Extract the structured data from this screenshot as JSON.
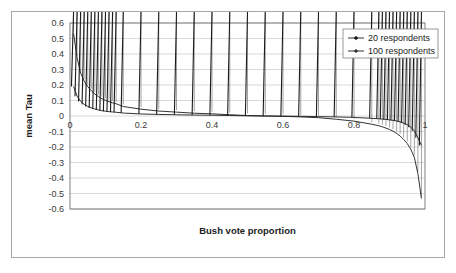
{
  "chart_data": {
    "type": "line",
    "title": "",
    "xlabel": "Bush vote proportion",
    "ylabel": "mean Tau",
    "xlim": [
      0,
      1
    ],
    "ylim": [
      -0.6,
      0.6
    ],
    "grid": true,
    "grid_axis": "y",
    "legend_position": "top-right",
    "xticks": [
      "0",
      "0.2",
      "0.4",
      "0.6",
      "0.8",
      "1"
    ],
    "xtick_values": [
      0,
      0.2,
      0.4,
      0.6,
      0.8,
      1
    ],
    "yticks": [
      "0.6",
      "0.5",
      "0.4",
      "0.3",
      "0.2",
      "0.1",
      "0",
      "-0.1",
      "-0.2",
      "-0.3",
      "-0.4",
      "-0.5",
      "-0.6"
    ],
    "ytick_values": [
      0.6,
      0.5,
      0.4,
      0.3,
      0.2,
      0.1,
      0,
      -0.1,
      -0.2,
      -0.3,
      -0.4,
      -0.5,
      -0.6
    ],
    "x": [
      0.01,
      0.02,
      0.03,
      0.04,
      0.05,
      0.06,
      0.07,
      0.08,
      0.09,
      0.1,
      0.11,
      0.12,
      0.13,
      0.15,
      0.2,
      0.25,
      0.3,
      0.35,
      0.4,
      0.45,
      0.5,
      0.55,
      0.6,
      0.65,
      0.7,
      0.75,
      0.8,
      0.85,
      0.87,
      0.88,
      0.89,
      0.9,
      0.91,
      0.92,
      0.93,
      0.94,
      0.95,
      0.96,
      0.97,
      0.98,
      0.99
    ],
    "series": [
      {
        "name": "20 respondents",
        "marker": "diamond",
        "color": "#1c1c1c",
        "values": [
          0.533,
          0.375,
          0.277,
          0.225,
          0.189,
          0.163,
          0.142,
          0.125,
          0.111,
          0.101,
          0.092,
          0.085,
          0.079,
          0.061,
          0.044,
          0.032,
          0.025,
          0.018,
          0.014,
          0.008,
          0.003,
          0.0,
          -0.002,
          -0.006,
          -0.011,
          -0.021,
          -0.033,
          -0.053,
          -0.063,
          -0.07,
          -0.078,
          -0.087,
          -0.098,
          -0.112,
          -0.129,
          -0.152,
          -0.178,
          -0.215,
          -0.268,
          -0.372,
          -0.533
        ]
      },
      {
        "name": "100 respondents",
        "marker": "cross",
        "color": "#1c1c1c",
        "values": [
          0.19,
          0.128,
          0.094,
          0.075,
          0.062,
          0.052,
          0.045,
          0.039,
          0.034,
          0.031,
          0.028,
          0.026,
          0.024,
          0.019,
          0.013,
          0.01,
          0.008,
          0.006,
          0.005,
          0.003,
          0.001,
          0.0,
          -0.001,
          -0.002,
          -0.004,
          -0.006,
          -0.009,
          -0.015,
          -0.018,
          -0.02,
          -0.022,
          -0.025,
          -0.028,
          -0.032,
          -0.038,
          -0.046,
          -0.056,
          -0.072,
          -0.096,
          -0.14,
          -0.19
        ]
      }
    ],
    "legend_entries": [
      "20 respondents",
      "100 respondents"
    ]
  },
  "colors": {
    "outer_border": "#a8a8a8",
    "plot_border": "#808080",
    "gridline": "#d9d9d9",
    "series": "#1c1c1c",
    "tick_text": "#3a3a3a",
    "background": "#ffffff"
  }
}
